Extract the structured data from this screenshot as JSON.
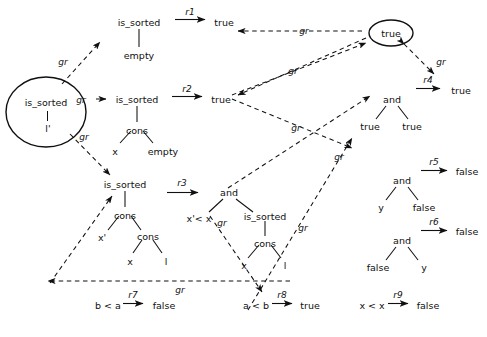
{
  "figure": {
    "name": "term-rewriting-dependency-graph",
    "edge_label": "gr",
    "background": "#ffffff",
    "ink": "#101010"
  },
  "rules": [
    {
      "id": "r1",
      "label": "r1",
      "lhs_root": "is_sorted",
      "lhs_children": [
        "empty"
      ],
      "rhs": "true",
      "x": 108,
      "y": 22
    },
    {
      "id": "r2",
      "label": "r2",
      "lhs_root": "is_sorted",
      "lhs_children": [
        "cons",
        "x",
        "empty"
      ],
      "rhs": "true",
      "x": 104,
      "y": 99
    },
    {
      "id": "r3",
      "label": "r3",
      "lhs_root": "is_sorted",
      "lhs_children": [
        "cons",
        "x'",
        "cons",
        "x",
        "l"
      ],
      "rhs_root": "and",
      "rhs_children": [
        "x' < x",
        "is_sorted",
        "cons",
        "x",
        "l"
      ],
      "x": 92,
      "y": 184
    },
    {
      "id": "r4",
      "label": "r4",
      "lhs_root": "and",
      "lhs_children": [
        "true",
        "true"
      ],
      "rhs": "true",
      "x": 392,
      "y": 99
    },
    {
      "id": "r5",
      "label": "r5",
      "lhs_root": "and",
      "lhs_children": [
        "y",
        "false"
      ],
      "rhs": "false",
      "x": 402,
      "y": 180
    },
    {
      "id": "r6",
      "label": "r6",
      "lhs_root": "and",
      "lhs_children": [
        "false",
        "y"
      ],
      "rhs": "false",
      "x": 402,
      "y": 240
    },
    {
      "id": "r7",
      "label": "r7",
      "lhs": "b < a",
      "rhs": "false",
      "x": 108,
      "y": 305
    },
    {
      "id": "r8",
      "label": "r8",
      "lhs": "a < b",
      "rhs": "true",
      "x": 256,
      "y": 305
    },
    {
      "id": "r9",
      "label": "r9",
      "lhs": "x < x",
      "rhs": "false",
      "x": 372,
      "y": 305
    }
  ],
  "terms": {
    "is_sorted": "is_sorted",
    "empty": "empty",
    "cons": "cons",
    "and": "and",
    "true": "true",
    "false": "false",
    "x": "x",
    "x_prime": "x'",
    "y": "y",
    "l": "l",
    "l_prime": "l'",
    "lt_xprime_x": "x'< x",
    "lt_b_a": "b < a",
    "lt_a_b": "a < b",
    "lt_x_x": "x < x"
  },
  "circled_nodes": [
    {
      "name": "root-is-sorted",
      "root": "is_sorted",
      "child": "l'",
      "cx": 46,
      "cy": 112
    },
    {
      "name": "root-true",
      "root": "true",
      "cx": 391,
      "cy": 33
    }
  ],
  "gr_labels": [
    {
      "id": "gr-a",
      "text": "gr",
      "x": 63,
      "y": 62
    },
    {
      "id": "gr-b",
      "text": "gr",
      "x": 81,
      "y": 100
    },
    {
      "id": "gr-c",
      "text": "gr",
      "x": 84,
      "y": 137
    },
    {
      "id": "gr-d",
      "text": "gr",
      "x": 304,
      "y": 31
    },
    {
      "id": "gr-e",
      "text": "gr",
      "x": 293,
      "y": 71
    },
    {
      "id": "gr-f",
      "text": "gr",
      "x": 296,
      "y": 128
    },
    {
      "id": "gr-g",
      "text": "gr",
      "x": 339,
      "y": 157
    },
    {
      "id": "gr-h",
      "text": "gr",
      "x": 441,
      "y": 62
    },
    {
      "id": "gr-i",
      "text": "gr",
      "x": 222,
      "y": 223
    },
    {
      "id": "gr-j",
      "text": "gr",
      "x": 303,
      "y": 228
    },
    {
      "id": "gr-k",
      "text": "gr",
      "x": 180,
      "y": 290
    }
  ]
}
